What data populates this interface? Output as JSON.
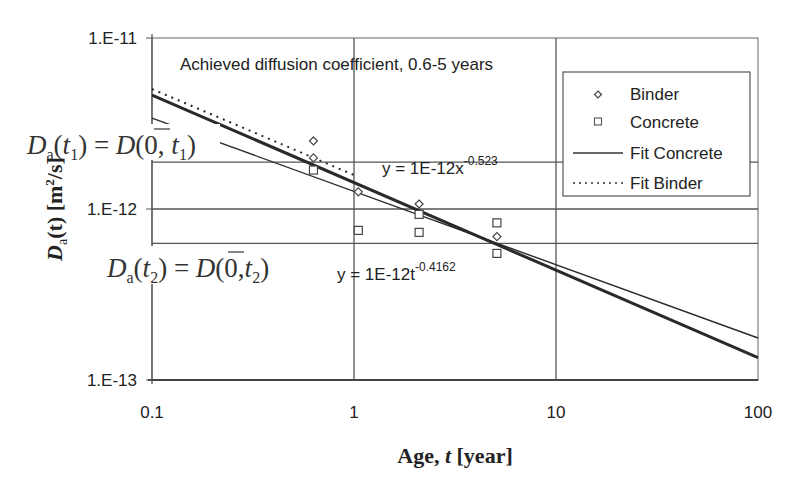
{
  "chart_data": {
    "type": "scatter",
    "title": "Achieved diffusion coefficient, 0.6-5 years",
    "xlabel": "Age, t [year]",
    "ylabel": "D_a(t) [m²/s]",
    "xscale": "log",
    "yscale": "log",
    "xlim": [
      0.1,
      100
    ],
    "ylim": [
      1e-13,
      1e-11
    ],
    "x_ticks": [
      "0.1",
      "1",
      "10",
      "100"
    ],
    "y_ticks": [
      "1.E-13",
      "1.E-12",
      "1.E-11"
    ],
    "grid": "major horizontal and vertical",
    "legend_position": "upper right",
    "legend": [
      "Binder",
      "Concrete",
      "Fit Concrete",
      "Fit Binder"
    ],
    "series": [
      {
        "name": "Binder",
        "marker": "diamond",
        "points": [
          [
            0.63,
            2.5e-12
          ],
          [
            0.63,
            1.99e-12
          ],
          [
            1.05,
            1.26e-12
          ],
          [
            2.1,
            1.07e-12
          ],
          [
            5.1,
            6.9e-13
          ]
        ]
      },
      {
        "name": "Concrete",
        "marker": "square",
        "points": [
          [
            0.63,
            1.69e-12
          ],
          [
            1.05,
            7.5e-13
          ],
          [
            2.1,
            9.3e-13
          ],
          [
            2.1,
            7.3e-13
          ],
          [
            5.1,
            8.3e-13
          ],
          [
            5.1,
            5.5e-13
          ]
        ]
      },
      {
        "name": "Fit Concrete",
        "line": "solid-thin",
        "equation": "y = 1E-12t^-0.4162",
        "endpoints": [
          [
            0.1,
            3.4e-12
          ],
          [
            100,
            1.76e-13
          ]
        ]
      },
      {
        "name": "Fit Binder",
        "line": "dotted",
        "equation": "y = 1E-12x^-0.523",
        "endpoints": [
          [
            0.1,
            5.03e-12
          ],
          [
            1.0,
            1.58e-12
          ]
        ]
      },
      {
        "name": "Fit (thick)",
        "line": "solid-thick",
        "endpoints": [
          [
            0.1,
            4.64e-12
          ],
          [
            100,
            1.35e-13
          ]
        ]
      }
    ],
    "reference_lines": [
      {
        "label": "D_a(t1) = D̄(0,t1)",
        "y": 1.88e-12
      },
      {
        "label": "D_a(t2) = D̄(0,t2)",
        "y": 6.3e-13
      }
    ],
    "annotations": [
      "y = 1E-12x^-0.523",
      "y = 1E-12t^-0.4162"
    ]
  },
  "text": {
    "title": "Achieved diffusion coefficient, 0.6-5 years",
    "eq_binder_base": "y = 1E-12x",
    "eq_binder_exp": "-0.523",
    "eq_concrete_base": "y = 1E-12t",
    "eq_concrete_exp": "-0.4162",
    "xlabel_a": "Age, ",
    "xlabel_t": "t",
    "xlabel_b": " [year]",
    "ylabel_D": "D",
    "ylabel_a": "a",
    "ylabel_rest": "(t) [m",
    "ylabel_sup": "2",
    "ylabel_end": "/s]",
    "legend_binder": "Binder",
    "legend_concrete": "Concrete",
    "legend_fit_concrete": "Fit Concrete",
    "legend_fit_binder": "Fit Binder",
    "ann1": {
      "D": "D",
      "a": "a",
      "lp": "(",
      "t": "t",
      "n": "1",
      "rp": ")",
      "eq": " = ",
      "Dbar": "D",
      "args": "(0, ",
      "t2": "t",
      "n2": "1",
      "end": ")"
    },
    "ann2": {
      "D": "D",
      "a": "a",
      "lp": "(",
      "t": "t",
      "n": "2",
      "rp": ")",
      "eq": " = ",
      "Dbar": "D",
      "args": "(0,",
      "t2": "t",
      "n2": "2",
      "end": ")"
    }
  },
  "colors": {
    "axis": "#555555",
    "grid": "#555555",
    "line": "#2a2a2a",
    "marker": "#444444",
    "background": "#ffffff"
  }
}
